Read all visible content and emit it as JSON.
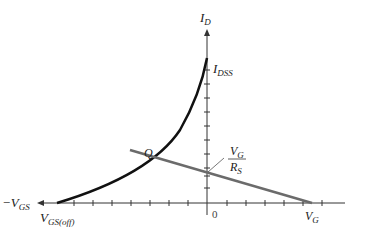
{
  "diagram": {
    "type": "JFET transfer characteristic with self-bias load line",
    "axes": {
      "y_label_main": "I",
      "y_label_sub": "D",
      "x_neg_label_main": "−V",
      "x_neg_label_sub": "GS",
      "origin_label": "0"
    },
    "labels": {
      "idss_main": "I",
      "idss_sub": "DSS",
      "vgsoff_main": "V",
      "vgsoff_sub": "GS(off)",
      "q_point": "Q",
      "vg_rs_num_main": "V",
      "vg_rs_num_sub": "G",
      "vg_rs_den_main": "R",
      "vg_rs_den_sub": "S",
      "vg_axis_main": "V",
      "vg_axis_sub": "G"
    },
    "colors": {
      "curve": "#111111",
      "load_line": "#6b6b6b",
      "axis": "#333333"
    }
  }
}
